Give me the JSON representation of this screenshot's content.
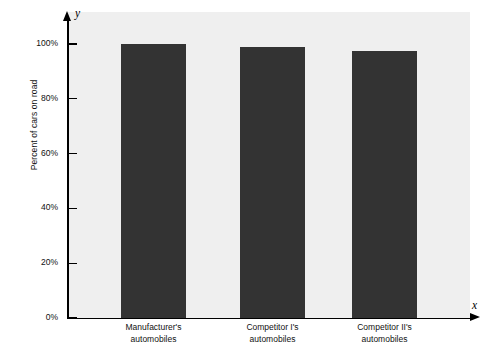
{
  "chart_data": {
    "type": "bar",
    "title": "",
    "subtitle": "",
    "xlabel": "",
    "ylabel": "Percent of cars on road",
    "x_axis_name": "x",
    "y_axis_name": "y",
    "categories": [
      "Manufacturer's automobiles",
      "Competitor I's automobiles",
      "Competitor II's automobiles"
    ],
    "category_lines": [
      [
        "Manufacturer's",
        "automobiles"
      ],
      [
        "Competitor I's",
        "automobiles"
      ],
      [
        "Competitor II's",
        "automobiles"
      ]
    ],
    "values": [
      100,
      99,
      97.5
    ],
    "ylim": [
      0,
      115
    ],
    "ytick_values": [
      0,
      20,
      40,
      60,
      80,
      100
    ],
    "ytick_labels": [
      "0%",
      "20%",
      "40%",
      "60%",
      "80%",
      "100%"
    ],
    "grid": false,
    "legend": null,
    "legend_position": "none",
    "bar_color": "#333333",
    "plot_background": "#efefef",
    "figure_background": "#ffffff",
    "axis_color": "#000000"
  }
}
